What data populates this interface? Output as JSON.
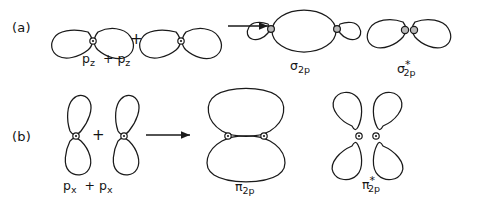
{
  "figure": {
    "background_color": "#ffffff",
    "stroke_color": "#1a1a1a",
    "nucleus_shaded_color": "#b9b9b9"
  },
  "panels": [
    {
      "id": "a",
      "label": "(a)",
      "reactant_label_parts": {
        "first": "p",
        "first_sub": "z",
        "operator": "+",
        "second": "p",
        "second_sub": "z"
      },
      "reactant_label_text": "pz + pz",
      "operator": "+",
      "arrow": "right-arrow",
      "products": [
        {
          "name": "sigma-bonding",
          "symbol": "σ",
          "subscript": "2p",
          "star": "",
          "label_text": "σ2p"
        },
        {
          "name": "sigma-antibonding",
          "symbol": "σ",
          "subscript": "2p",
          "star": "*",
          "label_text": "σ*2p"
        }
      ]
    },
    {
      "id": "b",
      "label": "(b)",
      "reactant_label_parts": {
        "first": "p",
        "first_sub": "x",
        "operator": "+",
        "second": "p",
        "second_sub": "x"
      },
      "reactant_label_text": "px + px",
      "operator": "+",
      "arrow": "right-arrow",
      "products": [
        {
          "name": "pi-bonding",
          "symbol": "π",
          "subscript": "2p",
          "star": "",
          "label_text": "π2p"
        },
        {
          "name": "pi-antibonding",
          "symbol": "π",
          "subscript": "2p",
          "star": "*",
          "label_text": "π*2p"
        }
      ]
    }
  ],
  "symbols": {
    "sigma": "σ",
    "pi": "π",
    "plus": "+",
    "star": "*",
    "subscript_2p": "2p",
    "subscript_z": "z",
    "subscript_x": "x",
    "p": "p"
  }
}
